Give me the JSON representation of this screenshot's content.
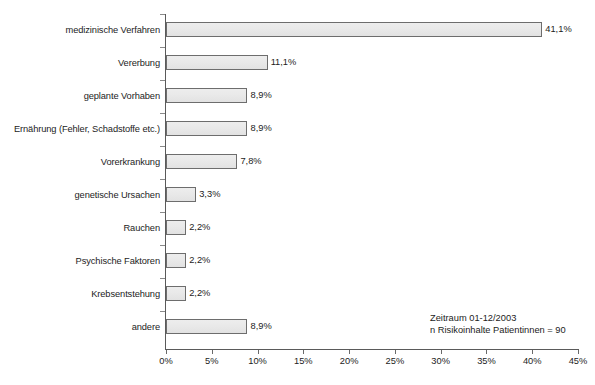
{
  "chart_data": {
    "type": "bar",
    "orientation": "horizontal",
    "title": "",
    "xlabel": "",
    "ylabel": "",
    "xlim": [
      0,
      45
    ],
    "grid": false,
    "legend": null,
    "tick_suffix": "%",
    "decimal_separator": ",",
    "categories": [
      "medizinische Verfahren",
      "Vererbung",
      "geplante Vorhaben",
      "Ernährung (Fehler, Schadstoffe etc.)",
      "Vorerkrankung",
      "genetische Ursachen",
      "Rauchen",
      "Psychische Faktoren",
      "Krebsentstehung",
      "andere"
    ],
    "values": [
      41.1,
      11.1,
      8.9,
      8.9,
      7.8,
      3.3,
      2.2,
      2.2,
      2.2,
      8.9
    ],
    "value_labels": [
      "41,1%",
      "11,1%",
      "8,9%",
      "8,9%",
      "7,8%",
      "3,3%",
      "2,2%",
      "2,2%",
      "2,2%",
      "8,9%"
    ],
    "xticks": [
      0,
      5,
      10,
      15,
      20,
      25,
      30,
      35,
      40,
      45
    ],
    "xtick_labels": [
      "0%",
      "5%",
      "10%",
      "15%",
      "20%",
      "25%",
      "30%",
      "35%",
      "40%",
      "45%"
    ],
    "annotation": [
      "Zeitraum 01-12/2003",
      "n Risikoinhalte Patientinnen = 90"
    ],
    "colors": {
      "bar_fill": "#e9e9e9",
      "bar_border": "#6d6d6d",
      "axis": "#5a5a5a",
      "text": "#1c1c1c",
      "background": "#ffffff"
    }
  }
}
